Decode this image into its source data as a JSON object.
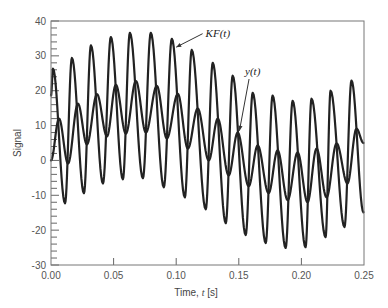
{
  "chart_data": {
    "type": "line",
    "title": "",
    "xlabel": "Time, t [s]",
    "xlabel_parts": {
      "prefix": "Time, ",
      "var": "t",
      "suffix": " [s]"
    },
    "ylabel": "Signal",
    "xlim": [
      0,
      0.25
    ],
    "ylim": [
      -30,
      40
    ],
    "x_ticks": [
      0,
      0.05,
      0.1,
      0.15,
      0.2,
      0.25
    ],
    "x_tick_labels": [
      "0.00",
      "0.05",
      "0.10",
      "0.15",
      "0.20",
      "0.25"
    ],
    "y_ticks": [
      -30,
      -20,
      -10,
      0,
      10,
      20,
      30,
      40
    ],
    "y_tick_labels": [
      "-30",
      "-20",
      "-10",
      "0",
      "10",
      "20",
      "30",
      "40"
    ],
    "y_minor_step": 2,
    "grid": false,
    "legend": "none",
    "series": [
      {
        "name": "KF(t)",
        "color": "#222222",
        "points_note": "local extrema (t, value) of an oscillating signal",
        "points": [
          [
            0.0,
            18.6
          ],
          [
            0.0016,
            26.3
          ],
          [
            0.0112,
            -12.3
          ],
          [
            0.0167,
            29.4
          ],
          [
            0.0263,
            -9.4
          ],
          [
            0.0319,
            33.0
          ],
          [
            0.0415,
            -6.6
          ],
          [
            0.0478,
            35.4
          ],
          [
            0.0574,
            -5.4
          ],
          [
            0.063,
            36.6
          ],
          [
            0.0734,
            -5.1
          ],
          [
            0.0797,
            36.6
          ],
          [
            0.0901,
            -7.7
          ],
          [
            0.0965,
            34.9
          ],
          [
            0.1069,
            -10.6
          ],
          [
            0.1124,
            31.7
          ],
          [
            0.1236,
            -14.0
          ],
          [
            0.1292,
            28.0
          ],
          [
            0.1396,
            -18.0
          ],
          [
            0.1451,
            24.3
          ],
          [
            0.1555,
            -21.4
          ],
          [
            0.1611,
            19.4
          ],
          [
            0.1715,
            -23.7
          ],
          [
            0.177,
            18.6
          ],
          [
            0.1874,
            -25.1
          ],
          [
            0.193,
            17.1
          ],
          [
            0.2033,
            -24.9
          ],
          [
            0.2081,
            17.7
          ],
          [
            0.2193,
            -22.0
          ],
          [
            0.2233,
            20.0
          ],
          [
            0.2344,
            -19.1
          ],
          [
            0.24,
            22.9
          ],
          [
            0.2496,
            -14.9
          ]
        ]
      },
      {
        "name": "y(t)",
        "color": "#222222",
        "points": [
          [
            0.0,
            0.0
          ],
          [
            0.0064,
            12.0
          ],
          [
            0.0136,
            -0.9
          ],
          [
            0.0215,
            16.3
          ],
          [
            0.0287,
            4.6
          ],
          [
            0.0367,
            19.0
          ],
          [
            0.0447,
            6.9
          ],
          [
            0.0518,
            21.7
          ],
          [
            0.0598,
            7.7
          ],
          [
            0.0678,
            22.8
          ],
          [
            0.0758,
            8.0
          ],
          [
            0.0845,
            21.4
          ],
          [
            0.0925,
            6.3
          ],
          [
            0.1013,
            19.1
          ],
          [
            0.1093,
            3.4
          ],
          [
            0.1172,
            14.9
          ],
          [
            0.126,
            0.0
          ],
          [
            0.1332,
            12.0
          ],
          [
            0.1419,
            -4.3
          ],
          [
            0.1491,
            8.0
          ],
          [
            0.1579,
            -7.4
          ],
          [
            0.1651,
            4.3
          ],
          [
            0.1738,
            -9.4
          ],
          [
            0.181,
            2.9
          ],
          [
            0.189,
            -11.4
          ],
          [
            0.197,
            2.3
          ],
          [
            0.2049,
            -12.0
          ],
          [
            0.2121,
            3.4
          ],
          [
            0.2201,
            -10.6
          ],
          [
            0.2281,
            4.9
          ],
          [
            0.2368,
            -6.6
          ],
          [
            0.244,
            9.1
          ],
          [
            0.2496,
            5.0
          ]
        ]
      }
    ],
    "annotations": [
      {
        "text": "KF(t)",
        "label_at": [
          0.1235,
          35.5
        ],
        "arrow_to": [
          0.1,
          32.5
        ]
      },
      {
        "text": "y(t)",
        "label_at": [
          0.155,
          24.5
        ],
        "arrow_to": [
          0.1505,
          8.5
        ]
      }
    ]
  }
}
